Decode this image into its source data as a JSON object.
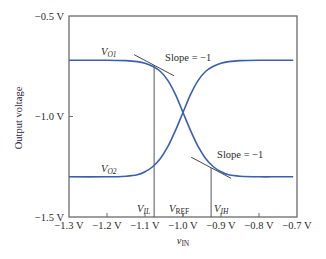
{
  "chart_data": {
    "type": "line",
    "title": "",
    "xlabel": "v_IN",
    "xlabel_main": "v",
    "xlabel_sub": "IN",
    "ylabel": "Output voltage",
    "xlim": [
      -1.3,
      -0.7
    ],
    "ylim": [
      -1.5,
      -0.5
    ],
    "grid": false,
    "x_ticks": [
      -1.3,
      -1.2,
      -1.1,
      -1.0,
      -0.9,
      -0.8,
      -0.7
    ],
    "x_tick_labels": [
      "−1.3 V",
      "−1.2 V",
      "−1.1 V",
      "−1.0 V",
      "−0.9 V",
      "−0.8 V",
      "−0.7 V"
    ],
    "y_ticks": [
      -0.5,
      -1.0,
      -1.5
    ],
    "y_tick_labels": [
      "−0.5 V",
      "−1.0 V",
      "−1.5 V"
    ],
    "series": [
      {
        "name": "V_O1",
        "label_main": "V",
        "label_sub": "O1",
        "color": "#3a5fae",
        "x": [
          -1.3,
          -1.2,
          -1.15,
          -1.12,
          -1.1,
          -1.08,
          -1.06,
          -1.04,
          -1.02,
          -1.0,
          -0.98,
          -0.96,
          -0.94,
          -0.92,
          -0.9,
          -0.88,
          -0.85,
          -0.8,
          -0.75,
          -0.71
        ],
        "y": [
          -0.72,
          -0.72,
          -0.722,
          -0.727,
          -0.735,
          -0.75,
          -0.775,
          -0.82,
          -0.89,
          -0.98,
          -1.07,
          -1.15,
          -1.21,
          -1.25,
          -1.275,
          -1.29,
          -1.297,
          -1.3,
          -1.3,
          -1.3
        ]
      },
      {
        "name": "V_O2",
        "label_main": "V",
        "label_sub": "O2",
        "color": "#3a5fae",
        "x": [
          -1.3,
          -1.2,
          -1.15,
          -1.12,
          -1.1,
          -1.08,
          -1.06,
          -1.04,
          -1.02,
          -1.0,
          -0.98,
          -0.96,
          -0.94,
          -0.92,
          -0.9,
          -0.88,
          -0.85,
          -0.8,
          -0.75,
          -0.71
        ],
        "y": [
          -1.3,
          -1.3,
          -1.297,
          -1.29,
          -1.275,
          -1.25,
          -1.21,
          -1.15,
          -1.07,
          -0.98,
          -0.89,
          -0.82,
          -0.775,
          -0.75,
          -0.735,
          -0.727,
          -0.722,
          -0.72,
          -0.72,
          -0.72
        ]
      }
    ],
    "annotations": [
      {
        "type": "vline",
        "x": -1.076,
        "label_main": "V",
        "label_sub": "IL",
        "name": "V_IL"
      },
      {
        "type": "vline",
        "x": -0.926,
        "label_main": "V",
        "label_sub": "IH",
        "name": "V_IH"
      },
      {
        "type": "marker-label",
        "x": -1.0,
        "label_main": "V",
        "label_sub": "REF",
        "name": "V_REF"
      },
      {
        "type": "tangent",
        "x": -1.076,
        "y": -0.745,
        "slope": -1,
        "text": "Slope = −1"
      },
      {
        "type": "tangent",
        "x": -0.926,
        "y": -1.255,
        "slope": -1,
        "text": "Slope = −1"
      }
    ]
  }
}
